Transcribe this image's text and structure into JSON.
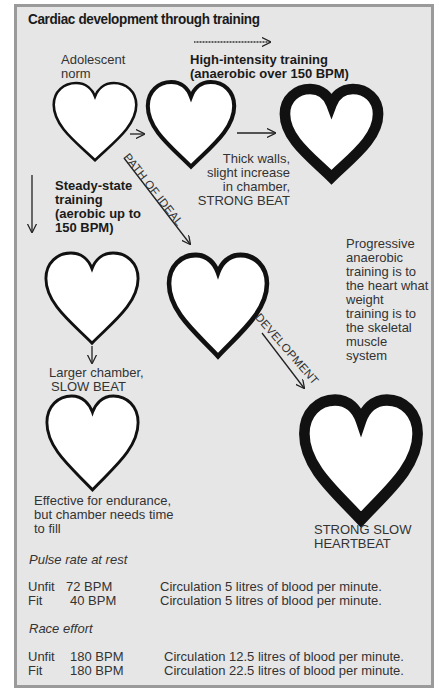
{
  "title": "Cardiac development through training",
  "labels": {
    "adolescent_line1": "Adolescent",
    "adolescent_line2": "norm",
    "high_intensity_line1": "High-intensity training",
    "high_intensity_line2": "(anaerobic over 150 BPM)",
    "thick_walls_line1": "Thick walls,",
    "thick_walls_line2": "slight increase",
    "thick_walls_line3": "in chamber,",
    "thick_walls_line4": "STRONG BEAT",
    "steady_line1": "Steady-state",
    "steady_line2": "training",
    "steady_line3": "(aerobic up to",
    "steady_line4": "150 BPM)",
    "path_of_ideal": "PATH OF IDEAL",
    "development": "DEVELOPMENT",
    "progressive_line1": "Progressive",
    "progressive_line2": "anaerobic",
    "progressive_line3": "training is to",
    "progressive_line4": "the heart what",
    "progressive_line5": "weight",
    "progressive_line6": "training is to",
    "progressive_line7": "the skeletal",
    "progressive_line8": "muscle",
    "progressive_line9": "system",
    "larger_line1": "Larger chamber,",
    "larger_line2": "SLOW BEAT",
    "effective_line1": "Effective for endurance,",
    "effective_line2": "but chamber needs time",
    "effective_line3": "to fill",
    "strong_slow_line1": "STRONG SLOW",
    "strong_slow_line2": "HEARTBEAT"
  },
  "pulse_rest": {
    "heading": "Pulse rate at rest",
    "rows": [
      {
        "group": "Unfit",
        "bpm": "72 BPM",
        "circulation": "Circulation 5 litres of blood per minute."
      },
      {
        "group": "Fit",
        "bpm": "40 BPM",
        "circulation": "Circulation 5 litres of blood per minute."
      }
    ]
  },
  "race_effort": {
    "heading": "Race effort",
    "rows": [
      {
        "group": "Unfit",
        "bpm": "180 BPM",
        "circulation": "Circulation 12.5 litres of blood per minute."
      },
      {
        "group": "Fit",
        "bpm": "180 BPM",
        "circulation": "Circulation 22.5 litres of blood per minute."
      }
    ]
  },
  "colors": {
    "panel_bg": "#e6e6e6",
    "panel_border": "#9a9a9a",
    "heart_fill": "#ffffff",
    "heart_stroke": "#111111"
  }
}
